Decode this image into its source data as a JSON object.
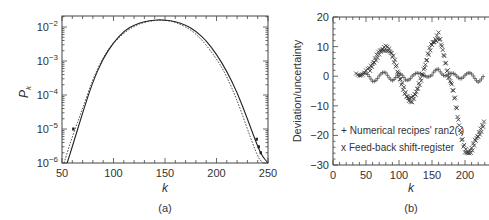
{
  "chart_data": [
    {
      "panel": "(a)",
      "type": "line",
      "title": "",
      "xlabel": "k",
      "ylabel": "P_k",
      "xlim": [
        50,
        250
      ],
      "ylim": [
        1e-06,
        0.021
      ],
      "yscale": "log",
      "xticks": [
        50,
        100,
        150,
        200,
        250
      ],
      "yticks": [
        "10^-6",
        "10^-5",
        "10^-4",
        "10^-3",
        "10^-2"
      ],
      "grid": false,
      "series": [
        {
          "name": "theory (solid)",
          "style": "solid",
          "x": [
            55,
            60,
            70,
            80,
            90,
            100,
            110,
            120,
            130,
            140,
            145,
            150,
            160,
            170,
            180,
            190,
            200,
            210,
            220,
            230,
            240,
            245,
            250
          ],
          "y": [
            1e-06,
            3e-06,
            3e-05,
            0.00025,
            0.0012,
            0.0035,
            0.0075,
            0.0115,
            0.0145,
            0.016,
            0.0162,
            0.016,
            0.0145,
            0.0115,
            0.0075,
            0.004,
            0.0016,
            0.0005,
            0.00012,
            2e-05,
            3e-06,
            1.5e-06,
            1e-06
          ]
        },
        {
          "name": "simulation (dotted)",
          "style": "dotted",
          "x": [
            52,
            60,
            70,
            80,
            90,
            100,
            120,
            140,
            150,
            160,
            180,
            200,
            210,
            220,
            230,
            240,
            245
          ],
          "y": [
            1e-06,
            6e-06,
            4e-05,
            0.0003,
            0.0013,
            0.0036,
            0.0115,
            0.016,
            0.0158,
            0.0142,
            0.007,
            0.0012,
            0.00035,
            7e-05,
            1e-05,
            1.5e-06,
            1e-06
          ]
        },
        {
          "name": "outlier points",
          "style": "markers",
          "x": [
            61,
            239,
            241,
            243
          ],
          "y": [
            1e-05,
            5e-06,
            3e-06,
            2e-06
          ]
        }
      ]
    },
    {
      "panel": "(b)",
      "type": "scatter",
      "title": "",
      "xlabel": "k",
      "ylabel": "Deviation/uncertainty",
      "xlim": [
        0,
        230
      ],
      "ylim": [
        -30,
        20
      ],
      "xticks": [
        0,
        50,
        100,
        150,
        200
      ],
      "yticks": [
        20,
        10,
        0,
        -10,
        -20,
        -30
      ],
      "grid": false,
      "legend": {
        "position": "lower left",
        "entries": [
          "+ Numerical recipes' ran2( )",
          "x Feed-back shift-register"
        ]
      },
      "series": [
        {
          "name": "Numerical recipes' ran2( )",
          "marker": "+",
          "x": [
            40,
            50,
            60,
            70,
            80,
            90,
            100,
            110,
            120,
            130,
            140,
            150,
            160,
            170,
            180,
            190,
            200,
            210,
            220,
            230
          ],
          "y": [
            1,
            0,
            -1,
            0,
            0.5,
            -0.5,
            0,
            -1,
            0.5,
            0,
            1,
            0,
            2,
            1,
            0,
            0,
            0.5,
            0,
            -1,
            0
          ]
        },
        {
          "name": "Feed-back shift-register",
          "marker": "x",
          "x": [
            35,
            45,
            55,
            60,
            65,
            70,
            75,
            80,
            85,
            90,
            95,
            100,
            105,
            110,
            115,
            120,
            125,
            130,
            135,
            140,
            145,
            150,
            155,
            160,
            165,
            170,
            175,
            180,
            185,
            190,
            195,
            200,
            205,
            210,
            215,
            220,
            225,
            230
          ],
          "y": [
            1,
            1,
            2,
            4,
            6,
            8,
            9,
            9.5,
            9,
            7,
            4,
            0,
            -3,
            -6,
            -8,
            -8,
            -6,
            -3,
            0,
            4,
            8,
            11,
            12,
            14,
            10,
            5,
            0,
            -3,
            -8,
            -15,
            -21,
            -25,
            -26,
            -25,
            -22,
            -20,
            -18,
            -15
          ]
        }
      ]
    }
  ],
  "panels": {
    "a": {
      "label": "(a)",
      "xlabel": "k",
      "ylabel_main": "P",
      "ylabel_sub": "k",
      "xtick_labels": [
        "50",
        "100",
        "150",
        "200",
        "250"
      ],
      "ytick_labels": [
        {
          "base": "10",
          "exp": "−6"
        },
        {
          "base": "10",
          "exp": "−5"
        },
        {
          "base": "10",
          "exp": "−4"
        },
        {
          "base": "10",
          "exp": "−3"
        },
        {
          "base": "10",
          "exp": "−2"
        }
      ]
    },
    "b": {
      "label": "(b)",
      "xlabel": "k",
      "ylabel": "Deviation/uncertainty",
      "xtick_labels": [
        "0",
        "50",
        "100",
        "150",
        "200"
      ],
      "ytick_labels": [
        "20",
        "10",
        "0",
        "−10",
        "−20",
        "−30"
      ],
      "legend": [
        {
          "marker": "+",
          "label": "Numerical recipes' ran2( )"
        },
        {
          "marker": "x",
          "label": "Feed-back shift-register"
        }
      ]
    }
  },
  "colors": {
    "ink": "#222222",
    "axis": "#444444",
    "background": "#ffffff"
  }
}
